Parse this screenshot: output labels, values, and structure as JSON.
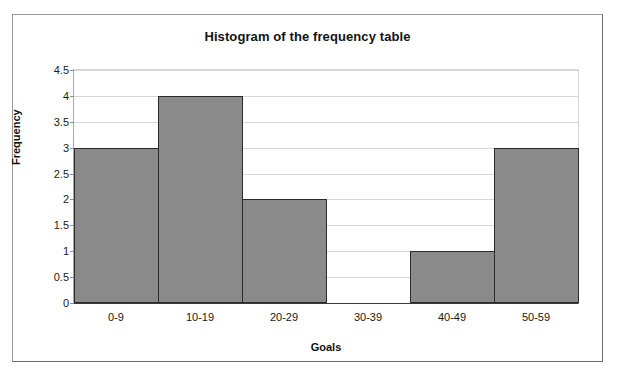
{
  "chart_data": {
    "type": "bar",
    "title": "Histogram of the frequency table",
    "xlabel": "Goals",
    "ylabel": "Frequency",
    "categories": [
      "0-9",
      "10-19",
      "20-29",
      "30-39",
      "40-49",
      "50-59"
    ],
    "values": [
      3,
      4,
      2,
      0,
      1,
      3
    ],
    "ylim": [
      0,
      4.5
    ],
    "yticks": [
      "0",
      "0.5",
      "1",
      "1.5",
      "2",
      "2.5",
      "3",
      "3.5",
      "4",
      "4.5"
    ],
    "ytick_values": [
      0,
      0.5,
      1,
      1.5,
      2,
      2.5,
      3,
      3.5,
      4,
      4.5
    ],
    "grid": true,
    "legend": false,
    "bar_gap": 0,
    "colors": {
      "bar_fill": "#8a8a8a",
      "bar_border": "#2b2b2b",
      "gridline": "#d8d8d8",
      "axis": "#3a3a3a",
      "text": "#141414",
      "frame": "#9a9a9a",
      "background": "#ffffff"
    }
  },
  "background_bleed": {
    "top": "",
    "mid": "",
    "mid2": "",
    "low1": "",
    "low2": "",
    "bottom": ""
  }
}
